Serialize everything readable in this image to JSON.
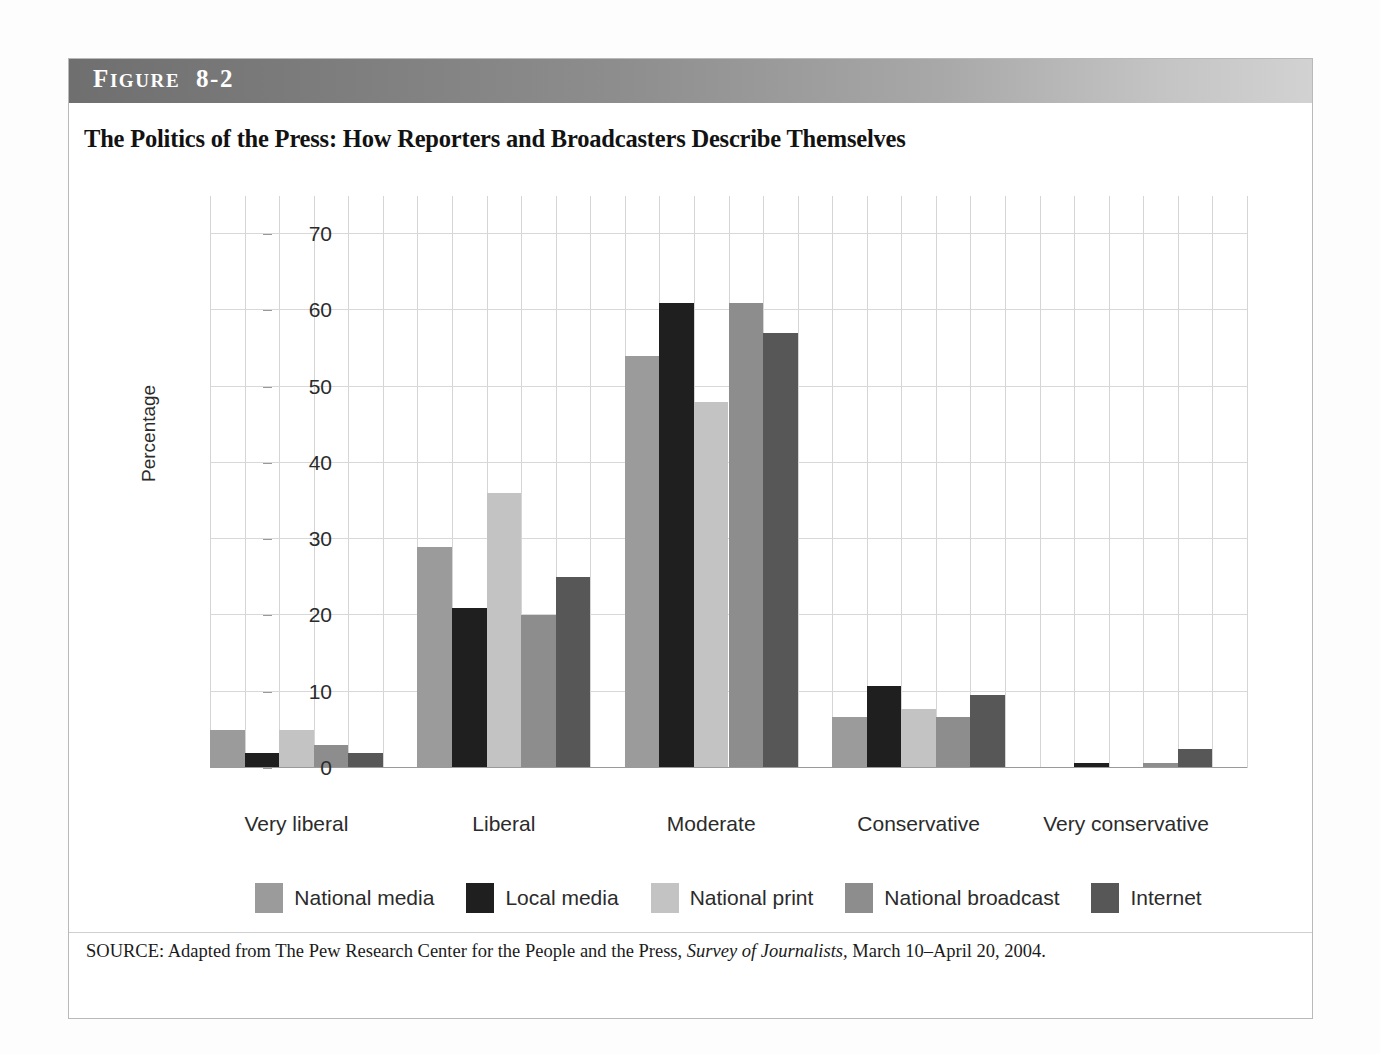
{
  "figure": {
    "band_label_first": "F",
    "band_label_rest": "IGURE",
    "band_number": "8-2",
    "title": "The Politics of the Press: How Reporters and Broadcasters Describe Themselves",
    "source_prefix": "SOURCE: Adapted from The Pew Research Center for the People and the Press,",
    "source_italic": "Survey of Journalists,",
    "source_suffix": "March 10–April 20, 2004."
  },
  "chart_data": {
    "type": "bar",
    "title": "The Politics of the Press: How Reporters and Broadcasters Describe Themselves",
    "xlabel": "",
    "ylabel": "Percentage",
    "ylim": [
      0,
      75
    ],
    "yticks": [
      0,
      10,
      20,
      30,
      40,
      50,
      60,
      70
    ],
    "ytick_labels": [
      "0",
      "10",
      "20",
      "30",
      "40",
      "50",
      "60",
      "70"
    ],
    "grid": true,
    "legend_position": "bottom",
    "categories": [
      "Very liberal",
      "Liberal",
      "Moderate",
      "Conservative",
      "Very conservative"
    ],
    "series": [
      {
        "name": "National media",
        "color": "#9b9b9b",
        "values": [
          5,
          29,
          54,
          6.7,
          0
        ]
      },
      {
        "name": "Local media",
        "color": "#1f1f1f",
        "values": [
          2,
          21,
          61,
          10.8,
          0.7
        ]
      },
      {
        "name": "National print",
        "color": "#c3c3c3",
        "values": [
          5,
          36,
          48,
          7.7,
          0
        ]
      },
      {
        "name": "National broadcast",
        "color": "#8d8d8d",
        "values": [
          3,
          20,
          61,
          6.7,
          0.6
        ]
      },
      {
        "name": "Internet",
        "color": "#575757",
        "values": [
          2,
          25,
          57,
          9.6,
          2.5
        ]
      }
    ]
  }
}
